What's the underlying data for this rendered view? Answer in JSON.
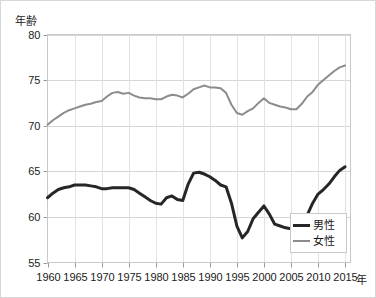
{
  "chart_data": {
    "type": "line",
    "title": "",
    "xlabel": "年",
    "ylabel": "年齢",
    "xlim": [
      1960,
      2016
    ],
    "ylim": [
      55,
      80
    ],
    "grid": true,
    "legend_position": "bottom-right",
    "x_ticks": [
      "1960",
      "1965",
      "1970",
      "1975",
      "1980",
      "1985",
      "1990",
      "1995",
      "2000",
      "2005",
      "2010",
      "2015"
    ],
    "y_ticks": [
      "55",
      "60",
      "65",
      "70",
      "75",
      "80"
    ],
    "x": [
      1960,
      1961,
      1962,
      1963,
      1964,
      1965,
      1966,
      1967,
      1968,
      1969,
      1970,
      1971,
      1972,
      1973,
      1974,
      1975,
      1976,
      1977,
      1978,
      1979,
      1980,
      1981,
      1982,
      1983,
      1984,
      1985,
      1986,
      1987,
      1988,
      1989,
      1990,
      1991,
      1992,
      1993,
      1994,
      1995,
      1996,
      1997,
      1998,
      1999,
      2000,
      2001,
      2002,
      2003,
      2004,
      2005,
      2006,
      2007,
      2008,
      2009,
      2010,
      2011,
      2012,
      2013,
      2014,
      2015
    ],
    "series": [
      {
        "name": "男性",
        "color": "#262626",
        "width": 3,
        "values": [
          62.1,
          62.6,
          63.0,
          63.2,
          63.3,
          63.5,
          63.5,
          63.5,
          63.4,
          63.3,
          63.1,
          63.1,
          63.2,
          63.2,
          63.2,
          63.2,
          63.0,
          62.6,
          62.2,
          61.8,
          61.5,
          61.4,
          62.1,
          62.3,
          61.9,
          61.8,
          63.6,
          64.8,
          64.9,
          64.7,
          64.4,
          64.0,
          63.5,
          63.3,
          61.5,
          59.0,
          57.7,
          58.4,
          59.8,
          60.5,
          61.2,
          60.3,
          59.2,
          59.0,
          58.8,
          58.7,
          58.8,
          59.0,
          60.2,
          61.5,
          62.5,
          63.0,
          63.6,
          64.4,
          65.1,
          65.5
        ]
      },
      {
        "name": "女性",
        "color": "#8c8c8c",
        "width": 2,
        "values": [
          70.1,
          70.6,
          71.0,
          71.4,
          71.7,
          71.9,
          72.1,
          72.3,
          72.4,
          72.6,
          72.7,
          73.2,
          73.6,
          73.7,
          73.5,
          73.6,
          73.3,
          73.1,
          73.0,
          73.0,
          72.9,
          72.9,
          73.2,
          73.4,
          73.3,
          73.1,
          73.5,
          74.0,
          74.2,
          74.4,
          74.2,
          74.2,
          74.1,
          73.6,
          72.3,
          71.4,
          71.2,
          71.6,
          71.9,
          72.5,
          73.0,
          72.5,
          72.3,
          72.1,
          72.0,
          71.8,
          71.8,
          72.4,
          73.2,
          73.7,
          74.5,
          75.0,
          75.5,
          76.0,
          76.4,
          76.6
        ]
      }
    ]
  }
}
